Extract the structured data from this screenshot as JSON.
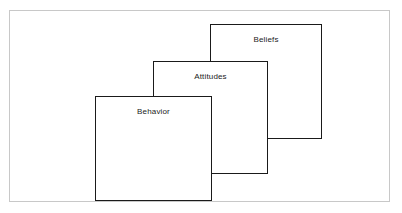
{
  "figure": {
    "kind": "stacked-overlapping-squares-diagram",
    "frame": {
      "border_color": "#c8c8c8",
      "background_color": "#ffffff"
    },
    "box_style": {
      "border_color": "#1a1a1a",
      "fill_color": "#ffffff",
      "label_color": "#1b1b1b"
    },
    "boxes": [
      {
        "id": "beliefs",
        "label": "Beliefs",
        "stack_position": "back",
        "z_order": 1
      },
      {
        "id": "attitudes",
        "label": "Attitudes",
        "stack_position": "middle",
        "z_order": 2
      },
      {
        "id": "behavior",
        "label": "Behavior",
        "stack_position": "front",
        "z_order": 3
      }
    ]
  }
}
